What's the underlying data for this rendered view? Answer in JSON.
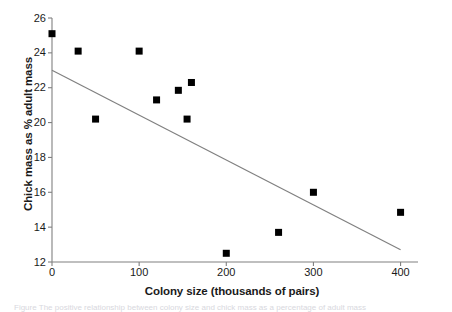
{
  "chart_data": {
    "type": "scatter",
    "title": "",
    "xlabel": "Colony size (thousands of pairs)",
    "ylabel": "Chick mass as % adult mass",
    "xlim": [
      0,
      420
    ],
    "ylim": [
      12,
      26
    ],
    "xticks": [
      0,
      100,
      200,
      300,
      400
    ],
    "yticks": [
      12,
      14,
      16,
      18,
      20,
      22,
      24,
      26
    ],
    "xtick_labels": [
      "0",
      "100",
      "200",
      "300",
      "400"
    ],
    "ytick_labels": [
      "12",
      "14",
      "16",
      "18",
      "20",
      "22",
      "24",
      "26"
    ],
    "grid": false,
    "legend": null,
    "marker": "square",
    "marker_color": "#000000",
    "axis_color": "#808080",
    "trendline_color": "#808080",
    "points": [
      {
        "x": 0,
        "y": 25.1
      },
      {
        "x": 30,
        "y": 24.1
      },
      {
        "x": 50,
        "y": 20.2
      },
      {
        "x": 100,
        "y": 24.1
      },
      {
        "x": 120,
        "y": 21.3
      },
      {
        "x": 145,
        "y": 21.85
      },
      {
        "x": 155,
        "y": 20.2
      },
      {
        "x": 160,
        "y": 22.3
      },
      {
        "x": 200,
        "y": 12.5
      },
      {
        "x": 260,
        "y": 13.7
      },
      {
        "x": 300,
        "y": 16.0
      },
      {
        "x": 400,
        "y": 14.85
      }
    ],
    "trendline": {
      "x1": 0,
      "y1": 23.0,
      "x2": 400,
      "y2": 12.7
    }
  },
  "caption": {
    "text": "Figure  The  positive relationship between colony size and chick mass as a percentage of adult mass"
  }
}
